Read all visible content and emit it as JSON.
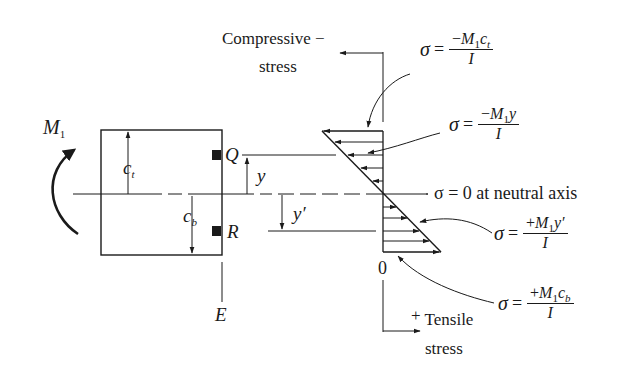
{
  "diagram": {
    "moment_label": {
      "symbol": "M",
      "subscript": "1"
    },
    "section": {
      "top_distance": {
        "symbol": "c",
        "subscript": "t"
      },
      "bottom_distance": {
        "symbol": "c",
        "subscript": "b"
      },
      "point_q": "Q",
      "point_r": "R",
      "edge_label": "E",
      "y_label": "y",
      "y_prime_label": "y′"
    },
    "stress_axis": {
      "top_label_line1": "Compressive",
      "top_label_line2": "stress",
      "top_sign": "−",
      "bottom_sign": "+",
      "bottom_label_line1": "Tensile",
      "bottom_label_line2": "stress",
      "origin_label": "0"
    },
    "equations": [
      {
        "id": "top-fiber",
        "sigma": "σ",
        "equals": "=",
        "numerator": "−M₁cₜ",
        "num_sign": "−",
        "num_M": "M",
        "num_sub": "1",
        "num_var": "c",
        "num_var_sub": "t",
        "denominator": "I"
      },
      {
        "id": "point-q",
        "sigma": "σ",
        "equals": "=",
        "num_sign": "−",
        "num_M": "M",
        "num_sub": "1",
        "num_var": "y",
        "num_var_sub": "",
        "denominator": "I"
      },
      {
        "id": "neutral-axis",
        "text": "σ = 0 at neutral axis"
      },
      {
        "id": "point-r",
        "sigma": "σ",
        "equals": "=",
        "num_sign": "+",
        "num_M": "M",
        "num_sub": "1",
        "num_var": "y′",
        "num_var_sub": "",
        "denominator": "I"
      },
      {
        "id": "bottom-fiber",
        "sigma": "σ",
        "equals": "=",
        "num_sign": "+",
        "num_M": "M",
        "num_sub": "1",
        "num_var": "c",
        "num_var_sub": "b",
        "denominator": "I"
      }
    ],
    "colors": {
      "line": "#1a1a1a",
      "background": "#ffffff"
    }
  }
}
